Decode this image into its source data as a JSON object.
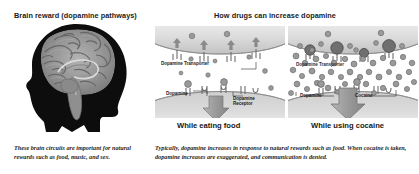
{
  "figure": {
    "background_color": "#ffffff",
    "text_color": "#1b1b1b"
  },
  "left_panel": {
    "title": "Brain reward (dopamine pathways)",
    "image_name": "human-head-profile-with-brain-illustration",
    "caption": "These brain circuits are important for natural rewards such as food, music, and sex.",
    "colors": {
      "head_silhouette": "#0d0d0d",
      "brain": "#8e8e8e"
    }
  },
  "right_section": {
    "title": "How drugs can increase dopamine",
    "caption": "Typically, dopamine increases in response to natural rewards such as food. When cocaine is taken, dopamine increases are exaggerated, and communication is denied.",
    "panels": [
      {
        "id": "food",
        "subcaption": "While eating food",
        "labels": [
          {
            "text": "Dopamine Transporter",
            "name": "dopamine-transporter-label"
          },
          {
            "text": "Dopamine",
            "name": "dopamine-label"
          },
          {
            "text": "Dopamine",
            "name": "dopamine-receptor-label-line1"
          },
          {
            "text": "Receptor",
            "name": "dopamine-receptor-label-line2"
          }
        ],
        "dopamine_count": 9,
        "cocaine_count": 0
      },
      {
        "id": "cocaine",
        "subcaption": "While using cocaine",
        "labels": [
          {
            "text": "Dopamine Transporter",
            "name": "dopamine-transporter-label"
          },
          {
            "text": "Dopamine",
            "name": "dopamine-label"
          },
          {
            "text": "Cocaine",
            "name": "cocaine-label"
          }
        ],
        "dopamine_count": 48,
        "cocaine_count": 4
      }
    ],
    "colors": {
      "membrane": "#d4d4d4",
      "dopamine_molecule": "#9a9a9a",
      "cocaine_molecule": "#6f6f6f",
      "arrow": "#999999"
    }
  }
}
